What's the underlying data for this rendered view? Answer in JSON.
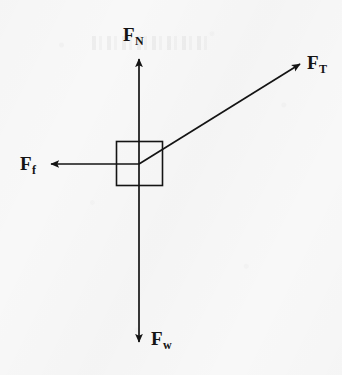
{
  "figure": {
    "kind": "free-body-diagram",
    "background_color": "#f8f8f8",
    "stroke_color": "#141414",
    "width": 342,
    "height": 375
  },
  "body": {
    "shape_name": "block",
    "x": 116,
    "y": 141,
    "width": 47,
    "height": 45,
    "stroke_color": "#141414"
  },
  "origin": {
    "x": 139,
    "y": 164
  },
  "forces": [
    {
      "key": "normal",
      "base": "F",
      "subscript": "N",
      "direction": "up",
      "angle_deg": 90,
      "tip": {
        "x": 139,
        "y": 56
      },
      "label_position": {
        "x": 123,
        "y": 25
      }
    },
    {
      "key": "tension",
      "base": "F",
      "subscript": "T",
      "direction": "up-right",
      "angle_deg": 32,
      "tip": {
        "x": 303,
        "y": 62
      },
      "label_position": {
        "x": 307,
        "y": 53
      }
    },
    {
      "key": "friction",
      "base": "F",
      "subscript": "f",
      "direction": "left",
      "angle_deg": 180,
      "tip": {
        "x": 48,
        "y": 164
      },
      "label_position": {
        "x": 20,
        "y": 154
      }
    },
    {
      "key": "weight",
      "base": "F",
      "subscript": "w",
      "direction": "down",
      "angle_deg": 270,
      "tip": {
        "x": 139,
        "y": 345
      },
      "label_position": {
        "x": 151,
        "y": 329
      }
    }
  ]
}
